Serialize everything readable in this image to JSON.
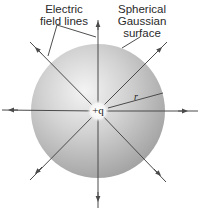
{
  "diagram": {
    "labels": {
      "field_lines_line1": "Electric",
      "field_lines_line2": "field lines",
      "surface_line1": "Spherical",
      "surface_line2": "Gaussian",
      "surface_line3": "surface",
      "charge": "+q",
      "radius": "r"
    },
    "colors": {
      "line": "#4a4a4a",
      "sphere_light": "#f2f2f2",
      "sphere_mid": "#c8c8c8",
      "sphere_dark": "#9a9a9a",
      "text": "#2a2a2a"
    },
    "field_line_count": 8
  }
}
